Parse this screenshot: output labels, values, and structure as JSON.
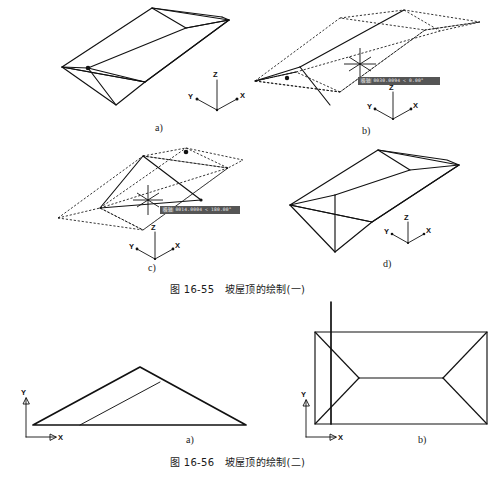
{
  "document": {
    "background_color": "#ffffff",
    "ink_color": "#111111",
    "top_cut_text": "",
    "width": 503,
    "height": 478
  },
  "figures": [
    {
      "id": "fig-16-55",
      "caption": "图 16-55　坡屋顶的绘制(一)",
      "caption_number": "图 16-55",
      "caption_title": "坡屋顶的绘制(一)",
      "panels": [
        {
          "id": "panel-a",
          "label": "a)",
          "description": "hip-roof solid isometric view",
          "axes": {
            "x": "X",
            "y": "Y",
            "z": "Z"
          },
          "has_tooltip": false,
          "tooltip": ""
        },
        {
          "id": "panel-b",
          "label": "b)",
          "description": "hip-roof wireframe with crosshair cursor",
          "axes": {
            "x": "X",
            "y": "Y",
            "z": "Z"
          },
          "has_tooltip": true,
          "tooltip_tag": "极轴",
          "tooltip_text": "0030.0094 < 0.00°"
        },
        {
          "id": "panel-c",
          "label": "c)",
          "description": "hip-roof wireframe mirrored with crosshair cursor",
          "axes": {
            "x": "X",
            "y": "Y",
            "z": "Z"
          },
          "has_tooltip": true,
          "tooltip_tag": "极轴",
          "tooltip_text": "0014.0004 < 180.00°"
        },
        {
          "id": "panel-d",
          "label": "d)",
          "description": "completed hip-roof solid isometric view",
          "axes": {
            "x": "X",
            "y": "Y",
            "z": "Z"
          },
          "has_tooltip": false,
          "tooltip": ""
        }
      ]
    },
    {
      "id": "fig-16-56",
      "caption": "图 16-56　坡屋顶的绘制(二)",
      "caption_number": "图 16-56",
      "caption_title": "坡屋顶的绘制(二)",
      "panels": [
        {
          "id": "panel-2a",
          "label": "a)",
          "description": "front elevation of hip roof, triangular gable",
          "axes": {
            "x": "X",
            "y": "Y"
          },
          "has_tooltip": false,
          "tooltip": ""
        },
        {
          "id": "panel-2b",
          "label": "b)",
          "description": "top plan view of hip roof with ridge and four hips",
          "axes": {
            "x": "X",
            "y": "Y"
          },
          "has_tooltip": false,
          "tooltip": ""
        }
      ]
    }
  ]
}
